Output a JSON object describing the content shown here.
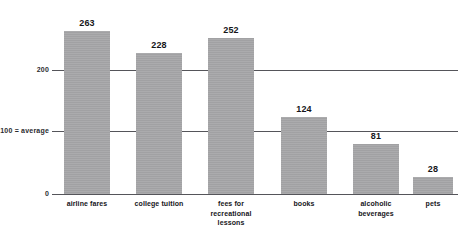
{
  "chart_data": {
    "type": "bar",
    "title": "",
    "xlabel": "",
    "ylabel": "",
    "categories": [
      "airline fares",
      "college tuition",
      "fees for\nrecreational\nlessons",
      "books",
      "alcoholic\nbeverages",
      "pets"
    ],
    "values": [
      263,
      228,
      252,
      124,
      81,
      28
    ],
    "value_labels": [
      "263",
      "228",
      "252",
      "124",
      "81",
      "28"
    ],
    "ylim": [
      0,
      280
    ],
    "yticks": [
      0,
      100,
      200
    ],
    "ytick_labels": [
      "0",
      "100 = average",
      "200"
    ],
    "grid": true,
    "gridlines_at": [
      100,
      200
    ],
    "legend": "none",
    "bar_color": "#a7a7a9",
    "axis_color": "#55555a",
    "text_color": "#16161a",
    "background": "#ffffff",
    "note": "100 = average"
  },
  "bars": [
    {
      "name": "airline-fares",
      "label": "airline fares",
      "value": 263,
      "value_label": "263",
      "x": 64,
      "width": 46
    },
    {
      "name": "college-tuition",
      "label": "college tuition",
      "value": 228,
      "value_label": "228",
      "x": 136,
      "width": 46
    },
    {
      "name": "fees-for-recreational-lessons",
      "label": "fees for recreational lessons",
      "value": 252,
      "value_label": "252",
      "x": 208,
      "width": 46
    },
    {
      "name": "books",
      "label": "books",
      "value": 124,
      "value_label": "124",
      "x": 281,
      "width": 46
    },
    {
      "name": "alcoholic-beverages",
      "label": "alcoholic beverages",
      "value": 81,
      "value_label": "81",
      "x": 353,
      "width": 46
    },
    {
      "name": "pets",
      "label": "pets",
      "value": 28,
      "value_label": "28",
      "x": 413,
      "width": 40
    }
  ],
  "category_lines": {
    "c0": [
      "airline fares"
    ],
    "c1": [
      "college tuition"
    ],
    "c2": [
      "fees for",
      "recreational",
      "lessons"
    ],
    "c3": [
      "books"
    ],
    "c4": [
      "alcoholic",
      "beverages"
    ],
    "c5": [
      "pets"
    ]
  },
  "axis": {
    "tick_200": "200",
    "tick_100": "100 = average",
    "tick_0": "0"
  }
}
